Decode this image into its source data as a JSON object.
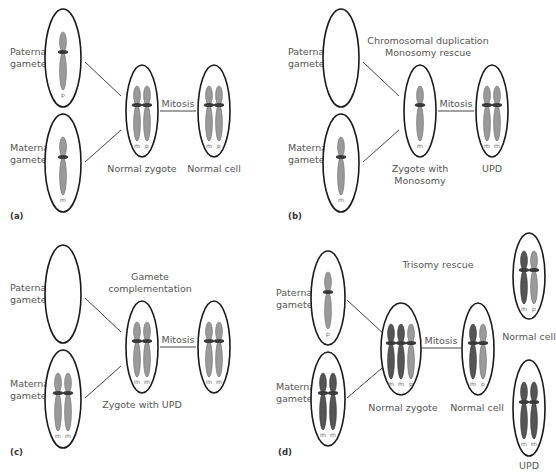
{
  "colors": {
    "light_chromosome": "#9a9a9a",
    "light_chromosome_stroke": "#6a6a6a",
    "dark_chromosome": "#555555",
    "dark_chromosome_stroke": "#333333",
    "centromere": "#3a3a3a",
    "cell_outline": "#1a1a1a",
    "text": "#555555"
  },
  "panels": [
    {
      "id": "a",
      "panel_label": "(a)",
      "title": "",
      "labels": {
        "paternal": [
          "Paternal",
          "gamete"
        ],
        "maternal": [
          "Maternal",
          "gamete"
        ],
        "mitosis": "Mitosis",
        "zygote": [
          "Normal zygote"
        ],
        "result": [
          "Normal cell"
        ]
      },
      "paternal_chromosomes": [
        {
          "tone": "light",
          "tag": "p"
        }
      ],
      "maternal_chromosomes": [
        {
          "tone": "light",
          "tag": "m"
        }
      ],
      "zygote_chromosomes": [
        {
          "tone": "light",
          "tag": "m"
        },
        {
          "tone": "light",
          "tag": "p"
        }
      ],
      "result_chromosomes": [
        {
          "tone": "light",
          "tag": "m"
        },
        {
          "tone": "light",
          "tag": "p"
        }
      ]
    },
    {
      "id": "b",
      "panel_label": "(b)",
      "title": [
        "Chromosomal duplication",
        "Monosomy rescue"
      ],
      "labels": {
        "paternal": [
          "Paternal",
          "gamete"
        ],
        "maternal": [
          "Maternal",
          "gamete"
        ],
        "mitosis": "Mitosis",
        "zygote": [
          "Zygote with",
          "Monosomy"
        ],
        "result": [
          "UPD"
        ]
      },
      "paternal_chromosomes": [],
      "maternal_chromosomes": [
        {
          "tone": "light",
          "tag": "m"
        }
      ],
      "zygote_chromosomes": [
        {
          "tone": "light",
          "tag": "m"
        }
      ],
      "result_chromosomes": [
        {
          "tone": "light",
          "tag": "m"
        },
        {
          "tone": "light",
          "tag": "m"
        }
      ]
    },
    {
      "id": "c",
      "panel_label": "(c)",
      "title": [
        "Gamete",
        "complementation"
      ],
      "labels": {
        "paternal": [
          "Paternal",
          "gamete"
        ],
        "maternal": [
          "Maternal",
          "gamete"
        ],
        "mitosis": "Mitosis",
        "zygote": [
          "Zygote with UPD"
        ],
        "result": []
      },
      "paternal_chromosomes": [],
      "maternal_chromosomes": [
        {
          "tone": "light",
          "tag": "m"
        },
        {
          "tone": "light",
          "tag": "m"
        }
      ],
      "zygote_chromosomes": [
        {
          "tone": "light",
          "tag": "m"
        },
        {
          "tone": "light",
          "tag": "m"
        }
      ],
      "result_chromosomes": [
        {
          "tone": "light",
          "tag": "m"
        },
        {
          "tone": "light",
          "tag": "m"
        }
      ]
    },
    {
      "id": "d",
      "panel_label": "(d)",
      "title": [
        "Trisomy rescue"
      ],
      "labels": {
        "paternal": [
          "Paternal",
          "gamete"
        ],
        "maternal": [
          "Maternal",
          "gamete"
        ],
        "mitosis": "Mitosis",
        "zygote": [
          "Normal zygote"
        ],
        "result": [
          "Normal cell"
        ],
        "outcome_top": [
          "Normal cell"
        ],
        "outcome_bottom": [
          "UPD"
        ]
      },
      "paternal_chromosomes": [
        {
          "tone": "light",
          "tag": "p"
        }
      ],
      "maternal_chromosomes": [
        {
          "tone": "dark",
          "tag": "m"
        },
        {
          "tone": "dark",
          "tag": "m"
        }
      ],
      "zygote_chromosomes": [
        {
          "tone": "dark",
          "tag": "m"
        },
        {
          "tone": "dark",
          "tag": "m"
        },
        {
          "tone": "light",
          "tag": "p"
        }
      ],
      "result_chromosomes": [
        {
          "tone": "dark",
          "tag": "m"
        },
        {
          "tone": "light",
          "tag": "p"
        }
      ],
      "outcome_top_chromosomes": [
        {
          "tone": "dark",
          "tag": "m"
        },
        {
          "tone": "light",
          "tag": "p"
        }
      ],
      "outcome_bottom_chromosomes": [
        {
          "tone": "dark",
          "tag": "m"
        },
        {
          "tone": "dark",
          "tag": "m"
        }
      ]
    }
  ]
}
